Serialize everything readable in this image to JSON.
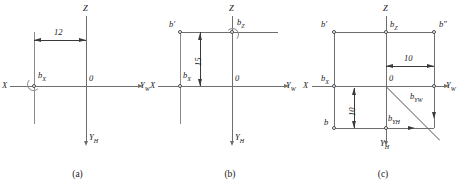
{
  "figure": {
    "type": "technical-drawing",
    "panels": [
      {
        "id": "a",
        "caption": "(a)",
        "axes": [
          {
            "name": "Z",
            "label": "Z",
            "direction": "up"
          },
          {
            "name": "X",
            "label": "X",
            "direction": "left"
          },
          {
            "name": "YW",
            "label": "Y",
            "sub": "W",
            "direction": "right"
          },
          {
            "name": "YH",
            "label": "Y",
            "sub": "H",
            "direction": "down"
          }
        ],
        "origin_label": "0",
        "points": [
          {
            "name": "bX",
            "label": "b",
            "sub": "X"
          }
        ],
        "dimensions": [
          {
            "value": "12",
            "orientation": "horizontal"
          }
        ]
      },
      {
        "id": "b",
        "caption": "(b)",
        "axes": [
          {
            "name": "Z",
            "label": "Z",
            "direction": "up"
          },
          {
            "name": "X",
            "label": "X",
            "direction": "left"
          },
          {
            "name": "YW",
            "label": "Y",
            "sub": "W",
            "direction": "right"
          },
          {
            "name": "YH",
            "label": "Y",
            "sub": "H",
            "direction": "down"
          }
        ],
        "origin_label": "0",
        "points": [
          {
            "name": "bPrime",
            "label": "b′"
          },
          {
            "name": "bZ",
            "label": "b",
            "sub": "Z"
          },
          {
            "name": "bX",
            "label": "b",
            "sub": "X"
          }
        ],
        "dimensions": [
          {
            "value": "15",
            "orientation": "vertical"
          }
        ]
      },
      {
        "id": "c",
        "caption": "(c)",
        "axes": [
          {
            "name": "Z",
            "label": "Z",
            "direction": "up"
          },
          {
            "name": "X",
            "label": "X",
            "direction": "left"
          },
          {
            "name": "YW",
            "label": "Y",
            "sub": "W",
            "direction": "right"
          },
          {
            "name": "YH",
            "label": "Y",
            "sub": "H",
            "direction": "down"
          }
        ],
        "origin_label": "0",
        "points": [
          {
            "name": "bPrime",
            "label": "b′"
          },
          {
            "name": "bZ",
            "label": "b",
            "sub": "Z"
          },
          {
            "name": "bDPrime",
            "label": "b″"
          },
          {
            "name": "bX",
            "label": "b",
            "sub": "X"
          },
          {
            "name": "bYW",
            "label": "b",
            "sub": "YW"
          },
          {
            "name": "bYH",
            "label": "b",
            "sub": "YH"
          },
          {
            "name": "b",
            "label": "b"
          }
        ],
        "dimensions": [
          {
            "value": "10",
            "orientation": "horizontal"
          },
          {
            "value": "10",
            "orientation": "vertical"
          }
        ]
      }
    ]
  },
  "labels": {
    "Z": "Z",
    "X": "X",
    "Y": "Y",
    "sub_W": "W",
    "sub_H": "H",
    "sub_X": "X",
    "sub_Z": "Z",
    "sub_YW": "YW",
    "sub_YH": "YH",
    "origin": "0",
    "b": "b",
    "b_prime": "b′",
    "b_double_prime": "b″"
  },
  "dimension_values": {
    "a_horizontal": "12",
    "b_vertical": "15",
    "c_horizontal": "10",
    "c_vertical": "10"
  },
  "captions": {
    "a": "(a)",
    "b": "(b)",
    "c": "(c)"
  },
  "colors": {
    "line": "#6e6e6e",
    "arrow": "#3a3a3a",
    "text": "#1a1a1a",
    "background": "#ffffff"
  }
}
